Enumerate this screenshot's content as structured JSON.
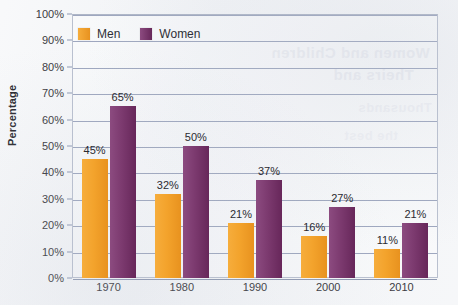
{
  "chart_data": {
    "type": "bar",
    "title": "",
    "xlabel": "",
    "ylabel": "Percentage",
    "ylim": [
      0,
      100
    ],
    "ytick_step": 10,
    "grid": true,
    "legend_position": "top-left-inside",
    "categories": [
      "1970",
      "1980",
      "1990",
      "2000",
      "2010"
    ],
    "ytick_labels": [
      "0%",
      "10%",
      "20%",
      "30%",
      "40%",
      "50%",
      "60%",
      "70%",
      "80%",
      "90%",
      "100%"
    ],
    "series": [
      {
        "name": "Men",
        "color": "#f3a32c",
        "values": [
          45,
          32,
          21,
          16,
          11
        ],
        "labels": [
          "45%",
          "32%",
          "21%",
          "16%",
          "11%"
        ]
      },
      {
        "name": "Women",
        "color": "#7c3a6f",
        "values": [
          65,
          50,
          37,
          27,
          21
        ],
        "labels": [
          "65%",
          "50%",
          "37%",
          "27%",
          "21%"
        ]
      }
    ]
  },
  "legend": {
    "items": [
      {
        "label": "Men",
        "color": "#f3a32c"
      },
      {
        "label": "Women",
        "color": "#7c3a6f"
      }
    ]
  },
  "showthrough": {
    "line1": "Women and Children",
    "line2": "Theirs and",
    "line3": "Thousands",
    "line4": "the best"
  }
}
